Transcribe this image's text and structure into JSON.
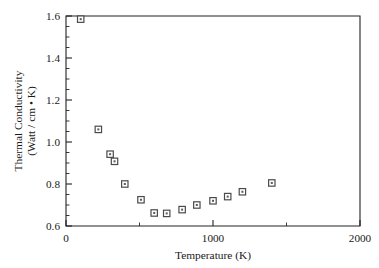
{
  "chart_data": {
    "type": "scatter",
    "title": "",
    "xlabel": "Temperature (K)",
    "ylabel_line1": "Thermal Conductivity",
    "ylabel_line2": "(Watt / cm • K)",
    "xlim": [
      0,
      2000
    ],
    "ylim": [
      0.6,
      1.6
    ],
    "x_major_ticks": [
      0,
      1000,
      2000
    ],
    "x_major_tick_labels": [
      "0",
      "1000",
      "2000"
    ],
    "x_minor_ticks": [
      500,
      1500
    ],
    "y_major_ticks": [
      0.6,
      0.8,
      1.0,
      1.2,
      1.4,
      1.6
    ],
    "y_major_tick_labels": [
      "0.6",
      "0.8",
      "1.0",
      "1.2",
      "1.4",
      "1.6"
    ],
    "y_minor_ticks": [
      0.65,
      0.7,
      0.75,
      0.85,
      0.9,
      0.95,
      1.05,
      1.1,
      1.15,
      1.25,
      1.3,
      1.35,
      1.45,
      1.5,
      1.55
    ],
    "grid": false,
    "legend": null,
    "marker_style": "open-square-with-center-dot",
    "marker_color": "#4a4a4a",
    "x": [
      100,
      220,
      300,
      330,
      400,
      510,
      600,
      685,
      790,
      890,
      1000,
      1100,
      1200,
      1400
    ],
    "y": [
      1.585,
      1.06,
      0.942,
      0.908,
      0.8,
      0.725,
      0.662,
      0.66,
      0.678,
      0.7,
      0.72,
      0.74,
      0.763,
      0.805
    ],
    "series": [
      {
        "name": "Thermal conductivity",
        "points": [
          {
            "x": 100,
            "y": 1.585
          },
          {
            "x": 220,
            "y": 1.06
          },
          {
            "x": 300,
            "y": 0.942
          },
          {
            "x": 330,
            "y": 0.908
          },
          {
            "x": 400,
            "y": 0.8
          },
          {
            "x": 510,
            "y": 0.725
          },
          {
            "x": 600,
            "y": 0.662
          },
          {
            "x": 685,
            "y": 0.66
          },
          {
            "x": 790,
            "y": 0.678
          },
          {
            "x": 890,
            "y": 0.7
          },
          {
            "x": 1000,
            "y": 0.72
          },
          {
            "x": 1100,
            "y": 0.74
          },
          {
            "x": 1200,
            "y": 0.763
          },
          {
            "x": 1400,
            "y": 0.805
          }
        ]
      }
    ]
  }
}
